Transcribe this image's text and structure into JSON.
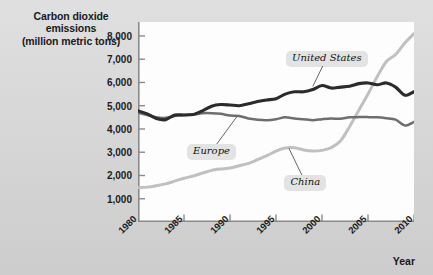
{
  "figure": {
    "background_color": "#d5d5d5",
    "plot_background_color": "#fdfdfd"
  },
  "axis_title": {
    "line1": "Carbon dioxide",
    "line2": "emissions",
    "line3": "(million metric tons)"
  },
  "xaxis_title": "Year",
  "callouts": [
    {
      "key": "united_states",
      "label": "United States"
    },
    {
      "key": "europe",
      "label": "Europe"
    },
    {
      "key": "china",
      "label": "China"
    }
  ],
  "chart_data": {
    "type": "line",
    "title": "Carbon dioxide emissions (million metric tons)",
    "xlabel": "Year",
    "ylabel": "Carbon dioxide emissions (million metric tons)",
    "xlim": [
      1980,
      2010
    ],
    "ylim": [
      0,
      8600
    ],
    "grid": false,
    "legend": "callout-labels-on-plot",
    "ytick_labels": [
      "1,000",
      "2,000",
      "3,000",
      "4,000",
      "5,000",
      "6,000",
      "7,000",
      "8,000"
    ],
    "ytick_values": [
      1000,
      2000,
      3000,
      4000,
      5000,
      6000,
      7000,
      8000
    ],
    "xtick_labels": [
      "1980",
      "1985",
      "1990",
      "1995",
      "2000",
      "2005",
      "2010"
    ],
    "xtick_values": [
      1980,
      1985,
      1990,
      1995,
      2000,
      2005,
      2010
    ],
    "x": [
      1980,
      1981,
      1982,
      1983,
      1984,
      1985,
      1986,
      1987,
      1988,
      1989,
      1990,
      1991,
      1992,
      1993,
      1994,
      1995,
      1996,
      1997,
      1998,
      1999,
      2000,
      2001,
      2002,
      2003,
      2004,
      2005,
      2006,
      2007,
      2008,
      2009,
      2010
    ],
    "series": [
      {
        "name": "United States",
        "color": "#2b2b2b",
        "width": 3.1,
        "values": [
          4780,
          4650,
          4450,
          4400,
          4600,
          4600,
          4620,
          4780,
          4980,
          5050,
          5030,
          5000,
          5080,
          5180,
          5250,
          5300,
          5500,
          5600,
          5600,
          5700,
          5870,
          5760,
          5800,
          5840,
          5950,
          5980,
          5900,
          5980,
          5800,
          5450,
          5600
        ]
      },
      {
        "name": "Europe",
        "color": "#6e6e6e",
        "width": 2.5,
        "values": [
          4700,
          4600,
          4500,
          4480,
          4560,
          4600,
          4620,
          4680,
          4680,
          4650,
          4580,
          4560,
          4450,
          4400,
          4380,
          4420,
          4500,
          4450,
          4420,
          4380,
          4420,
          4450,
          4440,
          4500,
          4510,
          4510,
          4500,
          4460,
          4400,
          4150,
          4300
        ]
      },
      {
        "name": "China",
        "color": "#c0c0c0",
        "width": 3.0,
        "values": [
          1480,
          1500,
          1560,
          1640,
          1760,
          1880,
          1980,
          2100,
          2220,
          2280,
          2320,
          2420,
          2520,
          2680,
          2850,
          3050,
          3180,
          3190,
          3100,
          3050,
          3080,
          3200,
          3480,
          4100,
          4800,
          5500,
          6250,
          6900,
          7200,
          7700,
          8100
        ]
      }
    ],
    "annotations": [
      {
        "text": "United States",
        "x": 2000.5,
        "y": 7050,
        "points_to": {
          "x": 1999.0,
          "y": 5830
        }
      },
      {
        "text": "Europe",
        "x": 1988.0,
        "y": 3050,
        "points_to": {
          "x": 1990.8,
          "y": 4560
        }
      },
      {
        "text": "China",
        "x": 1998.2,
        "y": 1700,
        "points_to": {
          "x": 1996.4,
          "y": 3170
        }
      }
    ]
  }
}
